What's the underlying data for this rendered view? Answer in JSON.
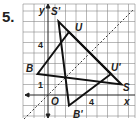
{
  "problem_number": "5.",
  "axes": {
    "x_label": "x",
    "y_label": "y",
    "origin_label": "O",
    "tick_labels": {
      "x": "4",
      "y_top": "4",
      "y_one": "1"
    }
  },
  "reflection_line": "y = x",
  "triangles": [
    {
      "name": "BUS",
      "points": {
        "B": [
          -1,
          2
        ],
        "U": [
          2,
          6
        ],
        "S": [
          7,
          1
        ]
      }
    },
    {
      "name": "B'U'S'",
      "points": {
        "B'": [
          2,
          -1
        ],
        "U'": [
          6,
          2
        ],
        "S'": [
          1,
          7
        ]
      }
    }
  ],
  "labels": {
    "S_prime": "S'",
    "U": "U",
    "B": "B",
    "U_prime": "U'",
    "S": "S",
    "B_prime": "B'"
  }
}
